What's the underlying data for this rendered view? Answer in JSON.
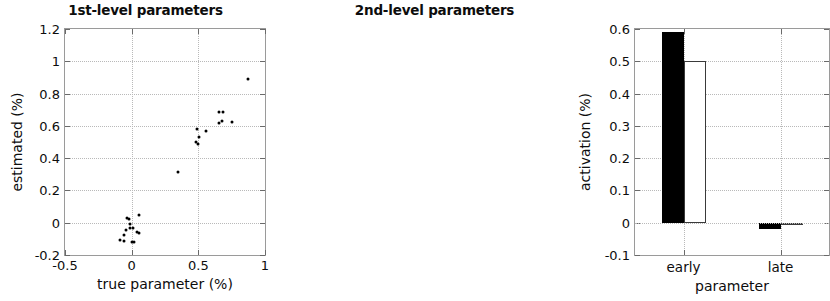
{
  "figure": {
    "width": 574,
    "height": 301,
    "background": "#ffffff",
    "foreground": "#000000"
  },
  "panels": [
    {
      "id": "left",
      "title": "1st-level parameters"
    },
    {
      "id": "right",
      "title": "2nd-level parameters"
    }
  ],
  "chart_data": [
    {
      "type": "scatter",
      "title": "1st-level parameters",
      "xlabel": "true parameter (%)",
      "ylabel": "estimated (%)",
      "xlim": [
        -0.5,
        1
      ],
      "ylim": [
        -0.2,
        1.2
      ],
      "xticks": [
        -0.5,
        0,
        0.5,
        1
      ],
      "xticklabels": [
        "-0.5",
        "0",
        "0.5",
        "1"
      ],
      "yticks": [
        -0.2,
        0,
        0.2,
        0.4,
        0.6,
        0.8,
        1,
        1.2
      ],
      "yticklabels": [
        "-0.2",
        "0",
        "0.2",
        "0.4",
        "0.6",
        "0.8",
        "1",
        "1.2"
      ],
      "grid": true,
      "legend": null,
      "marker": {
        "shape": "dot",
        "color": "#000000",
        "size": 3
      },
      "points": [
        {
          "x": 0.87,
          "y": 0.89
        },
        {
          "x": 0.655,
          "y": 0.685
        },
        {
          "x": 0.685,
          "y": 0.685
        },
        {
          "x": 0.68,
          "y": 0.63
        },
        {
          "x": 0.655,
          "y": 0.62
        },
        {
          "x": 0.755,
          "y": 0.625
        },
        {
          "x": 0.49,
          "y": 0.58
        },
        {
          "x": 0.56,
          "y": 0.57
        },
        {
          "x": 0.505,
          "y": 0.53
        },
        {
          "x": 0.48,
          "y": 0.5
        },
        {
          "x": 0.495,
          "y": 0.487
        },
        {
          "x": 0.345,
          "y": 0.315
        },
        {
          "x": 0.055,
          "y": 0.05
        },
        {
          "x": -0.035,
          "y": 0.03
        },
        {
          "x": -0.02,
          "y": 0.02
        },
        {
          "x": -0.01,
          "y": -0.005
        },
        {
          "x": -0.015,
          "y": -0.03
        },
        {
          "x": 0.01,
          "y": -0.03
        },
        {
          "x": -0.04,
          "y": -0.045
        },
        {
          "x": 0.04,
          "y": -0.055
        },
        {
          "x": 0.055,
          "y": -0.065
        },
        {
          "x": -0.06,
          "y": -0.075
        },
        {
          "x": -0.085,
          "y": -0.105
        },
        {
          "x": -0.06,
          "y": -0.115
        },
        {
          "x": 0.005,
          "y": -0.12
        },
        {
          "x": 0.02,
          "y": -0.118
        }
      ]
    },
    {
      "type": "bar",
      "title": "2nd-level parameters",
      "xlabel": "parameter",
      "ylabel": "activation (%)",
      "categories": [
        "early",
        "late"
      ],
      "ylim": [
        -0.1,
        0.6
      ],
      "yticks": [
        -0.1,
        0,
        0.1,
        0.2,
        0.3,
        0.4,
        0.5,
        0.6
      ],
      "yticklabels": [
        "-0.1",
        "0",
        "0.1",
        "0.2",
        "0.3",
        "0.4",
        "0.5",
        "0.6"
      ],
      "grid": true,
      "legend": null,
      "series": [
        {
          "name": "filled",
          "style": "black-filled",
          "color": "#000000",
          "values": [
            0.59,
            -0.02
          ]
        },
        {
          "name": "hollow",
          "style": "white-outlined",
          "color": "#ffffff",
          "values": [
            0.5,
            0.0
          ]
        }
      ]
    }
  ]
}
